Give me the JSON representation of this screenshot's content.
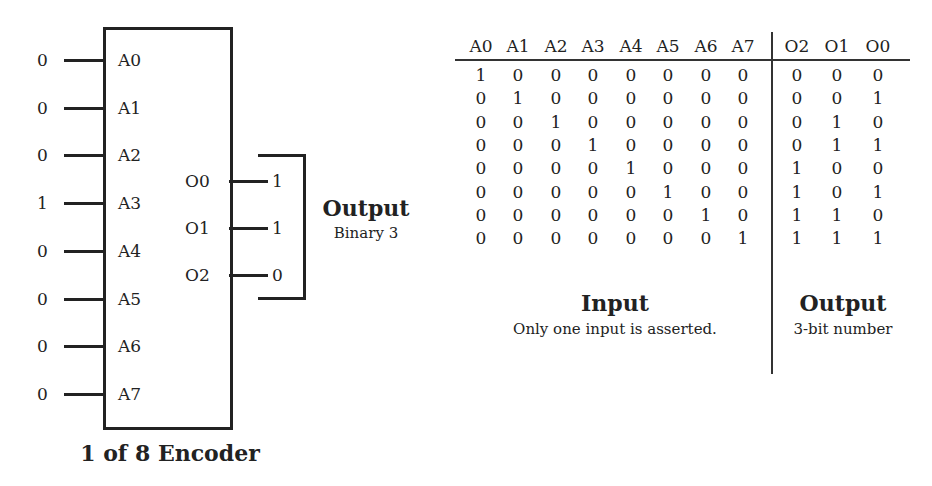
{
  "encoder": {
    "title": "1 of 8 Encoder",
    "inputs": [
      {
        "label": "A0",
        "value": "0"
      },
      {
        "label": "A1",
        "value": "0"
      },
      {
        "label": "A2",
        "value": "0"
      },
      {
        "label": "A3",
        "value": "1"
      },
      {
        "label": "A4",
        "value": "0"
      },
      {
        "label": "A5",
        "value": "0"
      },
      {
        "label": "A6",
        "value": "0"
      },
      {
        "label": "A7",
        "value": "0"
      }
    ],
    "outputs": [
      {
        "label": "O0",
        "value": "1"
      },
      {
        "label": "O1",
        "value": "1"
      },
      {
        "label": "O2",
        "value": "0"
      }
    ],
    "output_group": {
      "title": "Output",
      "subtitle": "Binary 3"
    }
  },
  "truth_table": {
    "input_headers": [
      "A0",
      "A1",
      "A2",
      "A3",
      "A4",
      "A5",
      "A6",
      "A7"
    ],
    "output_headers": [
      "O2",
      "O1",
      "O0"
    ],
    "rows": [
      {
        "in": [
          "1",
          "0",
          "0",
          "0",
          "0",
          "0",
          "0",
          "0"
        ],
        "out": [
          "0",
          "0",
          "0"
        ]
      },
      {
        "in": [
          "0",
          "1",
          "0",
          "0",
          "0",
          "0",
          "0",
          "0"
        ],
        "out": [
          "0",
          "0",
          "1"
        ]
      },
      {
        "in": [
          "0",
          "0",
          "1",
          "0",
          "0",
          "0",
          "0",
          "0"
        ],
        "out": [
          "0",
          "1",
          "0"
        ]
      },
      {
        "in": [
          "0",
          "0",
          "0",
          "1",
          "0",
          "0",
          "0",
          "0"
        ],
        "out": [
          "0",
          "1",
          "1"
        ]
      },
      {
        "in": [
          "0",
          "0",
          "0",
          "0",
          "1",
          "0",
          "0",
          "0"
        ],
        "out": [
          "1",
          "0",
          "0"
        ]
      },
      {
        "in": [
          "0",
          "0",
          "0",
          "0",
          "0",
          "1",
          "0",
          "0"
        ],
        "out": [
          "1",
          "0",
          "1"
        ]
      },
      {
        "in": [
          "0",
          "0",
          "0",
          "0",
          "0",
          "0",
          "1",
          "0"
        ],
        "out": [
          "1",
          "1",
          "0"
        ]
      },
      {
        "in": [
          "0",
          "0",
          "0",
          "0",
          "0",
          "0",
          "0",
          "1"
        ],
        "out": [
          "1",
          "1",
          "1"
        ]
      }
    ],
    "input_caption": {
      "title": "Input",
      "subtitle": "Only one input is asserted."
    },
    "output_caption": {
      "title": "Output",
      "subtitle": "3-bit number"
    }
  }
}
